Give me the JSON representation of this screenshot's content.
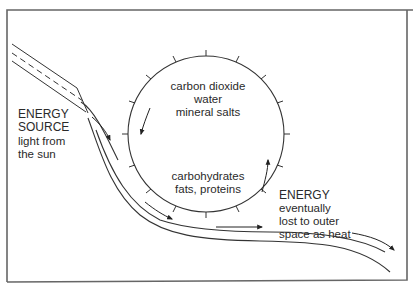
{
  "diagram": {
    "colors": {
      "line": "#333333",
      "frame": "#555555",
      "background": "#ffffff"
    },
    "cycle": {
      "inputs": [
        "carbon dioxide",
        "water",
        "mineral salts"
      ],
      "products": [
        "carbohydrates",
        "fats, proteins"
      ]
    },
    "energy_source": {
      "heading": [
        "ENERGY",
        "SOURCE"
      ],
      "description": [
        "light from",
        "the sun"
      ]
    },
    "energy_loss": {
      "heading": "ENERGY",
      "description": [
        "eventually",
        "lost to outer",
        "space as heat"
      ]
    }
  }
}
